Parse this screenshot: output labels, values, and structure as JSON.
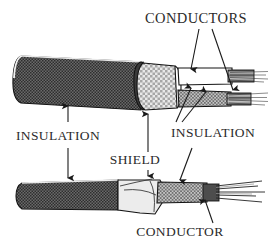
{
  "figure": {
    "background_color": "#ffffff",
    "line_color": "#1a1a1a",
    "text_color": "#2b2b2b",
    "width": 269,
    "height": 246
  },
  "labels": {
    "conductors": "CONDUCTORS",
    "insulation_left": "INSULATION",
    "insulation_right": "INSULATION",
    "shield": "SHIELD",
    "conductor": "CONDUCTOR"
  },
  "materials": {
    "jacket_fill": "#5a5a5a",
    "jacket_name": "outer-insulation-jacket",
    "braid_fill": "#c9c9c9",
    "braid_name": "braided-shield",
    "inner_insulation_fill": "#9a9a9a",
    "inner_insulation_name": "inner-conductor-insulation",
    "foil_fill": "#e4e4e4",
    "foil_name": "folded-shield-foil",
    "conductor_fill": "#8f8f8f",
    "conductor_name": "stranded-copper-conductor",
    "white_fill": "#ffffff"
  },
  "cables": {
    "upper": {
      "name": "upper-cable-cutaway",
      "layers": [
        "outer insulation",
        "braided shield",
        "inner insulation",
        "conductors"
      ],
      "conductor_count": 2
    },
    "lower": {
      "name": "lower-cable-cutaway",
      "layers": [
        "outer insulation",
        "shield",
        "insulation",
        "conductor"
      ],
      "conductor_count": 1
    }
  }
}
